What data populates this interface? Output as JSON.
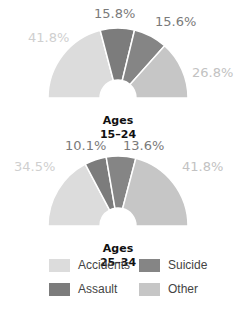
{
  "chart_data": [
    {
      "type": "pie",
      "subtype": "semicircle-donut",
      "title": "Ages 15-24",
      "label_lines": [
        "Ages",
        "15–24"
      ],
      "categories": [
        "Accidents",
        "Assault",
        "Suicide",
        "Other"
      ],
      "values": [
        41.8,
        15.8,
        15.6,
        26.8
      ],
      "labels": [
        "41.8%",
        "15.8%",
        "15.6%",
        "26.8%"
      ]
    },
    {
      "type": "pie",
      "subtype": "semicircle-donut",
      "title": "Ages 25-34",
      "label_lines": [
        "Ages",
        "25–34"
      ],
      "categories": [
        "Accidents",
        "Assault",
        "Suicide",
        "Other"
      ],
      "values": [
        34.5,
        10.1,
        13.6,
        41.8
      ],
      "labels": [
        "34.5%",
        "10.1%",
        "13.6%",
        "41.8%"
      ]
    }
  ],
  "colors": {
    "Accidents": "#dcdcdc",
    "Assault": "#7c7c7c",
    "Suicide": "#858585",
    "Other": "#c6c6c6"
  },
  "label_colors": {
    "Accidents": "#cfcfcf",
    "Assault": "#7a7a7a",
    "Suicide": "#7a7a7a",
    "Other": "#c2c2c2"
  },
  "legend": [
    {
      "label": "Accidents",
      "key": "Accidents"
    },
    {
      "label": "Suicide",
      "key": "Suicide"
    },
    {
      "label": "Assault",
      "key": "Assault"
    },
    {
      "label": "Other",
      "key": "Other"
    }
  ]
}
